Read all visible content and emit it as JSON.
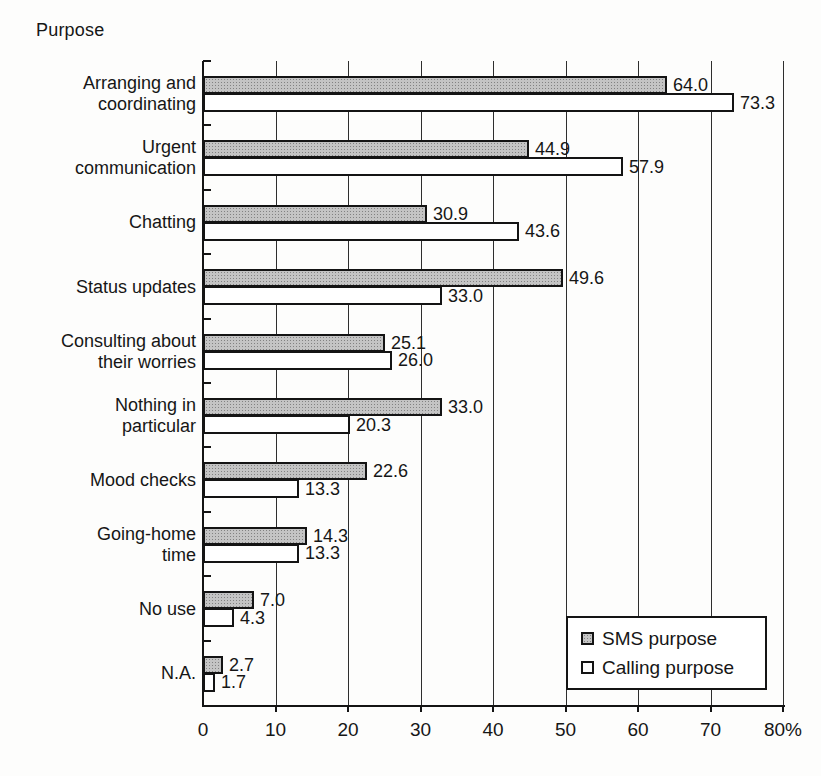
{
  "chart_data": {
    "type": "bar",
    "orientation": "horizontal",
    "axis_corner_label": "Purpose",
    "categories": [
      "Arranging and\ncoordinating",
      "Urgent\ncommunication",
      "Chatting",
      "Status updates",
      "Consulting about\ntheir worries",
      "Nothing in\nparticular",
      "Mood checks",
      "Going-home\ntime",
      "No use",
      "N.A."
    ],
    "series": [
      {
        "name": "SMS purpose",
        "values": [
          64.0,
          44.9,
          30.9,
          49.6,
          25.1,
          33.0,
          22.6,
          14.3,
          7.0,
          2.7
        ],
        "fill": "#c4c4c4",
        "pattern": "halftone-dots",
        "border": "#141414"
      },
      {
        "name": "Calling purpose",
        "values": [
          73.3,
          57.9,
          43.6,
          33.0,
          26.0,
          20.3,
          13.3,
          13.3,
          4.3,
          1.7
        ],
        "fill": "#ffffff",
        "border": "#141414"
      }
    ],
    "x_axis": {
      "min": 0,
      "max": 80,
      "tick_step": 10,
      "tick_labels": [
        "0",
        "10",
        "20",
        "30",
        "40",
        "50",
        "60",
        "70",
        "80%"
      ]
    },
    "value_labels_shown": true,
    "value_label_decimals": 1,
    "gridlines": "vertical",
    "legend": {
      "position": "inside-bottom-right",
      "entries": [
        "SMS purpose",
        "Calling purpose"
      ]
    }
  }
}
